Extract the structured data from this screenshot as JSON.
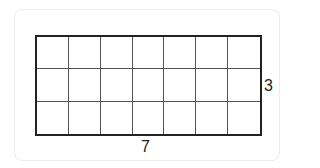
{
  "diagram": {
    "type": "area-model-grid",
    "columns": 7,
    "rows": 3,
    "width_label": "7",
    "height_label": "3",
    "colors": {
      "line": "#222222",
      "frame": "#ececec"
    }
  }
}
